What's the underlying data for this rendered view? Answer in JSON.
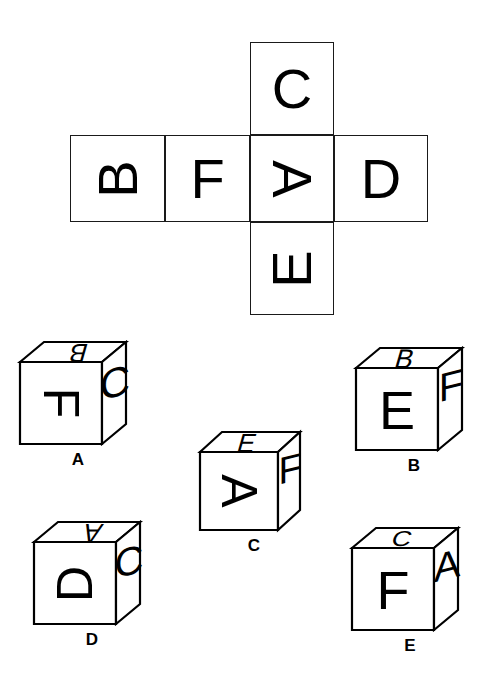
{
  "puzzle": {
    "type": "cube-net-folding",
    "background_color": "#ffffff",
    "line_color": "#000000"
  },
  "net": {
    "shape": "cross",
    "description": "Unfolded cube net arranged as a cross with a vertical column of three squares and a horizontal row of four squares sharing the middle square.",
    "cells": [
      {
        "id": "c",
        "letter": "C",
        "rotation": 0,
        "row": "top",
        "col": 3
      },
      {
        "id": "b",
        "letter": "B",
        "rotation": -90,
        "row": "middle",
        "col": 1
      },
      {
        "id": "f",
        "letter": "F",
        "rotation": 0,
        "row": "middle",
        "col": 2
      },
      {
        "id": "a",
        "letter": "A",
        "rotation": 90,
        "row": "middle",
        "col": 3
      },
      {
        "id": "d",
        "letter": "D",
        "rotation": 0,
        "row": "middle",
        "col": 4
      },
      {
        "id": "e",
        "letter": "E",
        "rotation": -90,
        "row": "bottom",
        "col": 3
      }
    ]
  },
  "options": [
    {
      "label": "A",
      "faces": {
        "front": "F",
        "top": "B",
        "right": "C"
      },
      "front_rotation": 90,
      "top_rotation": 180,
      "right_rotation": 0
    },
    {
      "label": "B",
      "faces": {
        "front": "E",
        "top": "B",
        "right": "F"
      },
      "front_rotation": 0,
      "top_rotation": 0,
      "right_rotation": 0
    },
    {
      "label": "C",
      "faces": {
        "front": "A",
        "top": "E",
        "right": "F"
      },
      "front_rotation": 90,
      "top_rotation": 0,
      "right_rotation": 0
    },
    {
      "label": "D",
      "faces": {
        "front": "D",
        "top": "A",
        "right": "C"
      },
      "front_rotation": -90,
      "top_rotation": 180,
      "right_rotation": 0
    },
    {
      "label": "E",
      "faces": {
        "front": "F",
        "top": "C",
        "right": "A"
      },
      "front_rotation": 0,
      "top_rotation": 0,
      "right_rotation": 0
    }
  ]
}
